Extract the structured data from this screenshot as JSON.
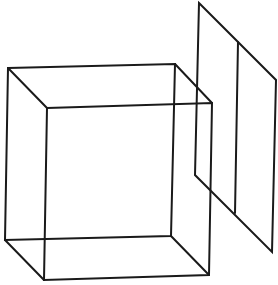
{
  "figure": {
    "stroke_color": "#1a1a1a",
    "background_color": "#ffffff",
    "cube": {
      "back_face": [
        [
          8,
          68
        ],
        [
          175,
          64
        ],
        [
          171,
          236
        ],
        [
          5,
          240
        ]
      ],
      "front_face": [
        [
          47,
          108
        ],
        [
          212,
          103
        ],
        [
          209,
          275
        ],
        [
          44,
          280
        ]
      ],
      "depth_edges": [
        [
          [
            8,
            68
          ],
          [
            47,
            108
          ]
        ],
        [
          [
            175,
            64
          ],
          [
            212,
            103
          ]
        ],
        [
          [
            171,
            236
          ],
          [
            209,
            275
          ]
        ],
        [
          [
            5,
            240
          ],
          [
            44,
            280
          ]
        ]
      ]
    },
    "plane": {
      "outline": [
        [
          199,
          3
        ],
        [
          276,
          80
        ],
        [
          272,
          252
        ],
        [
          195,
          175
        ]
      ],
      "divider": [
        [
          238,
          42
        ],
        [
          235,
          213
        ]
      ]
    }
  }
}
